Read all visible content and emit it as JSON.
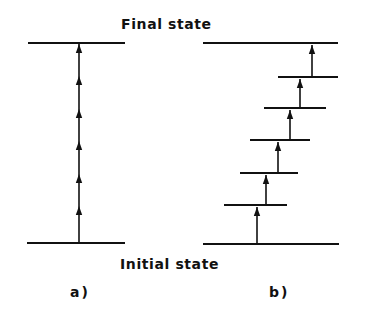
{
  "labels": {
    "final_state": "Final state",
    "initial_state": "Initial state",
    "panel_a": "a)",
    "panel_b": "b)"
  },
  "colors": {
    "ink": "#111111",
    "background": "#ffffff"
  },
  "panel_a": {
    "description": "Direct multiphoton transition from initial to final state via virtual steps",
    "top_level": {
      "y": 43,
      "x1": 28,
      "x2": 125
    },
    "bottom_level": {
      "y": 243,
      "x1": 27,
      "x2": 125
    },
    "transition_x": 79,
    "arrowhead_y": [
      48,
      80,
      113,
      145,
      178,
      210
    ]
  },
  "panel_b": {
    "description": "Stepwise transition through real intermediate levels",
    "top_level": {
      "y": 43,
      "x1": 203,
      "x2": 338
    },
    "bottom_level": {
      "y": 244,
      "x1": 203,
      "x2": 339
    },
    "intermediate_levels": [
      {
        "y": 77,
        "x1": 278,
        "x2": 338
      },
      {
        "y": 108,
        "x1": 264,
        "x2": 326
      },
      {
        "y": 140,
        "x1": 250,
        "x2": 310
      },
      {
        "y": 173,
        "x1": 240,
        "x2": 298
      },
      {
        "y": 205,
        "x1": 224,
        "x2": 287
      }
    ],
    "transitions": [
      {
        "x": 257,
        "y_from": 244,
        "y_to": 205
      },
      {
        "x": 266,
        "y_from": 205,
        "y_to": 173
      },
      {
        "x": 278,
        "y_from": 173,
        "y_to": 140
      },
      {
        "x": 290,
        "y_from": 140,
        "y_to": 108
      },
      {
        "x": 300,
        "y_from": 108,
        "y_to": 77
      },
      {
        "x": 312,
        "y_from": 77,
        "y_to": 43
      }
    ]
  }
}
